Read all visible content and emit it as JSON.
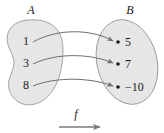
{
  "figure": {
    "type": "function-mapping-diagram",
    "domain_set": {
      "name": "A",
      "label": "A",
      "shape": "bean-blob",
      "elements": [
        {
          "label": "1",
          "x": 26,
          "y": 41
        },
        {
          "label": "3",
          "x": 26,
          "y": 63
        },
        {
          "label": "8",
          "x": 26,
          "y": 85
        }
      ]
    },
    "codomain_set": {
      "name": "B",
      "label": "B",
      "shape": "tilted-ellipse",
      "elements": [
        {
          "label": "5",
          "x": 127,
          "y": 43
        },
        {
          "label": "7",
          "x": 127,
          "y": 65
        },
        {
          "label": "−10",
          "x": 132,
          "y": 88
        }
      ]
    },
    "mapping": {
      "function_label": "f",
      "pairs": [
        {
          "from": "1",
          "to": "5"
        },
        {
          "from": "3",
          "to": "7"
        },
        {
          "from": "8",
          "to": "−10"
        }
      ]
    },
    "colors": {
      "blob_fill": "#e6e6e6",
      "blob_stroke": "#9a9a9a",
      "arrow_stroke": "#6e6e6e",
      "text": "#1a1a1a",
      "background": "#ffffff"
    }
  }
}
